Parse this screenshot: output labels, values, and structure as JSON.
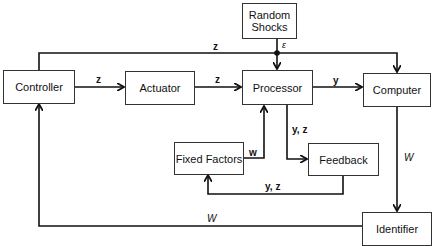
{
  "diagram": {
    "nodes": {
      "random_shocks": {
        "label_line1": "Random",
        "label_line2": "Shocks"
      },
      "controller": {
        "label": "Controller"
      },
      "actuator": {
        "label": "Actuator"
      },
      "processor": {
        "label": "Processor"
      },
      "computer": {
        "label": "Computer"
      },
      "fixed_factors": {
        "label": "Fixed Factors"
      },
      "feedback": {
        "label": "Feedback"
      },
      "identifier": {
        "label": "Identifier"
      }
    },
    "edges": {
      "controller_to_computer_top": "z",
      "controller_to_actuator": "z",
      "actuator_to_processor": "z",
      "shocks_to_processor": "ε",
      "processor_to_computer": "y",
      "processor_to_feedback": "y, z",
      "fixed_factors_to_processor": "w",
      "feedback_to_fixed_factors": "y, z",
      "computer_to_identifier": "W",
      "identifier_to_controller": "W"
    },
    "colors": {
      "line": "#111111",
      "box_border": "#333333",
      "background": "#ffffff"
    }
  }
}
